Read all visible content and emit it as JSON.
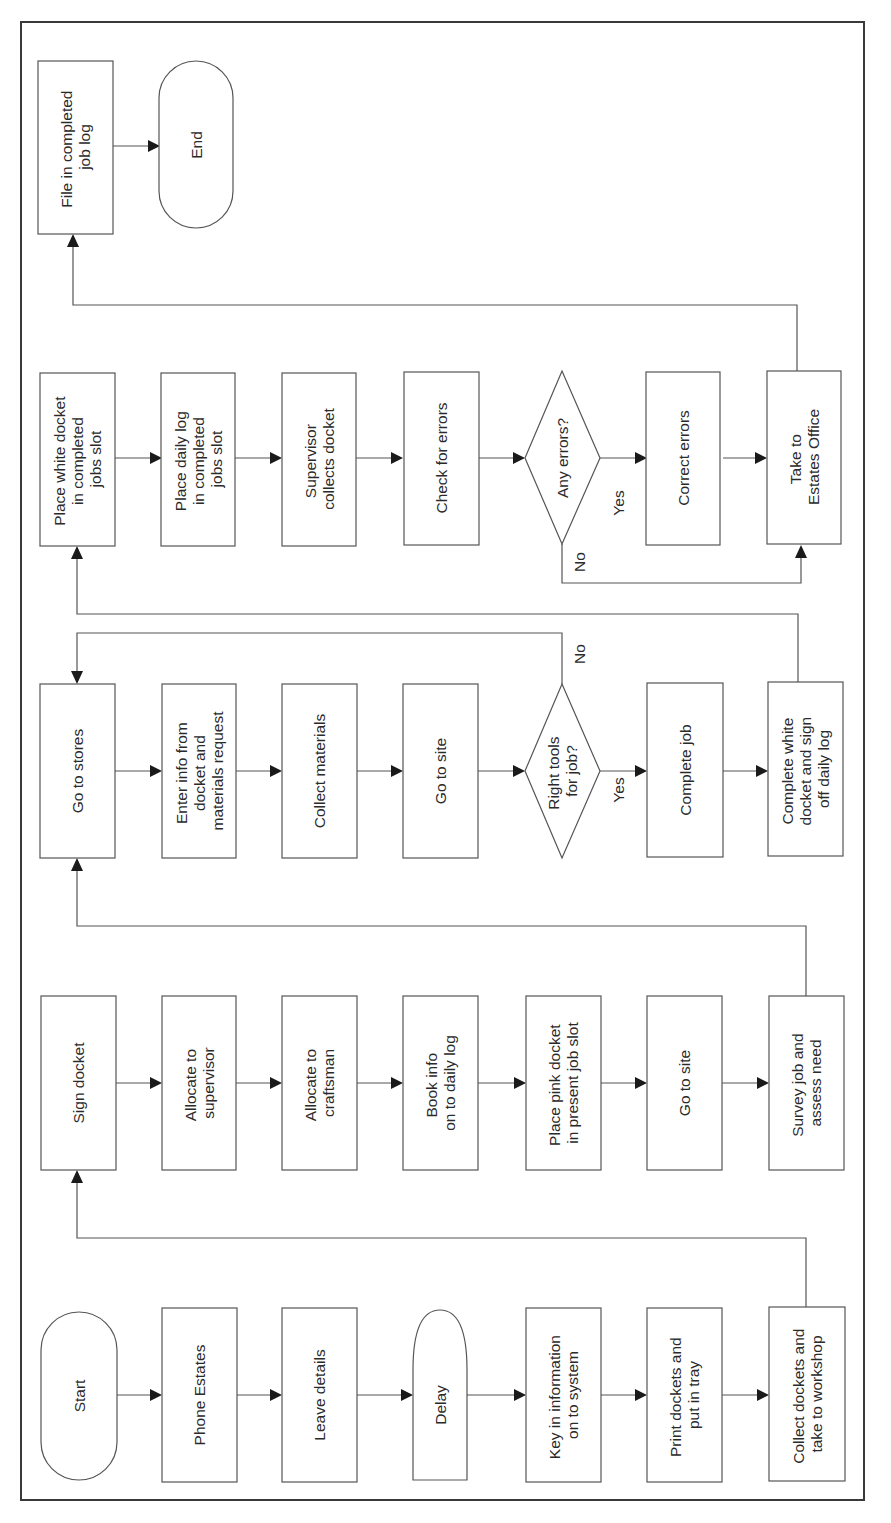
{
  "diagram": {
    "type": "flowchart",
    "orientation": "rotated-90-ccw",
    "nodes": {
      "start": {
        "shape": "terminator",
        "lines": [
          "Start"
        ]
      },
      "phone_estates": {
        "shape": "process",
        "lines": [
          "Phone Estates"
        ]
      },
      "leave_details": {
        "shape": "process",
        "lines": [
          "Leave details"
        ]
      },
      "delay": {
        "shape": "delay",
        "lines": [
          "Delay"
        ]
      },
      "key_in_info": {
        "shape": "process",
        "lines": [
          "Key in information",
          "on to system"
        ]
      },
      "print_dockets": {
        "shape": "process",
        "lines": [
          "Print dockets and",
          "put in tray"
        ]
      },
      "collect_dockets": {
        "shape": "process",
        "lines": [
          "Collect dockets and",
          "take to workshop"
        ]
      },
      "sign_docket": {
        "shape": "process",
        "lines": [
          "Sign docket"
        ]
      },
      "allocate_supervisor": {
        "shape": "process",
        "lines": [
          "Allocate to",
          "supervisor"
        ]
      },
      "allocate_craftsman": {
        "shape": "process",
        "lines": [
          "Allocate to",
          "craftsman"
        ]
      },
      "book_info": {
        "shape": "process",
        "lines": [
          "Book info",
          "on to daily log"
        ]
      },
      "place_pink_docket": {
        "shape": "process",
        "lines": [
          "Place pink docket",
          "in present job slot"
        ]
      },
      "go_to_site_1": {
        "shape": "process",
        "lines": [
          "Go to site"
        ]
      },
      "survey_job": {
        "shape": "process",
        "lines": [
          "Survey job and",
          "assess need"
        ]
      },
      "go_to_stores": {
        "shape": "process",
        "lines": [
          "Go to stores"
        ]
      },
      "enter_info": {
        "shape": "process",
        "lines": [
          "Enter info from",
          "docket and",
          "materials request"
        ]
      },
      "collect_materials": {
        "shape": "process",
        "lines": [
          "Collect materials"
        ]
      },
      "go_to_site_2": {
        "shape": "process",
        "lines": [
          "Go to site"
        ]
      },
      "right_tools": {
        "shape": "decision",
        "lines": [
          "Right tools",
          "for job?"
        ]
      },
      "complete_job": {
        "shape": "process",
        "lines": [
          "Complete job"
        ]
      },
      "complete_white_docket": {
        "shape": "process",
        "lines": [
          "Complete white",
          "docket and sign",
          "off daily log"
        ]
      },
      "place_white_docket": {
        "shape": "process",
        "lines": [
          "Place white docket",
          "in completed",
          "jobs slot"
        ]
      },
      "place_daily_log": {
        "shape": "process",
        "lines": [
          "Place daily log",
          "in completed",
          "jobs slot"
        ]
      },
      "supervisor_collects": {
        "shape": "process",
        "lines": [
          "Supervisor",
          "collects docket"
        ]
      },
      "check_errors": {
        "shape": "process",
        "lines": [
          "Check for errors"
        ]
      },
      "any_errors": {
        "shape": "decision",
        "lines": [
          "Any errors?"
        ]
      },
      "correct_errors": {
        "shape": "process",
        "lines": [
          "Correct errors"
        ]
      },
      "take_to_estates": {
        "shape": "process",
        "lines": [
          "Take to",
          "Estates Office"
        ]
      },
      "file_completed": {
        "shape": "process",
        "lines": [
          "File in completed",
          "job log"
        ]
      },
      "end": {
        "shape": "terminator",
        "lines": [
          "End"
        ]
      }
    },
    "edges": [
      {
        "from": "start",
        "to": "phone_estates"
      },
      {
        "from": "phone_estates",
        "to": "leave_details"
      },
      {
        "from": "leave_details",
        "to": "delay"
      },
      {
        "from": "delay",
        "to": "key_in_info"
      },
      {
        "from": "key_in_info",
        "to": "print_dockets"
      },
      {
        "from": "print_dockets",
        "to": "collect_dockets"
      },
      {
        "from": "collect_dockets",
        "to": "sign_docket"
      },
      {
        "from": "sign_docket",
        "to": "allocate_supervisor"
      },
      {
        "from": "allocate_supervisor",
        "to": "allocate_craftsman"
      },
      {
        "from": "allocate_craftsman",
        "to": "book_info"
      },
      {
        "from": "book_info",
        "to": "place_pink_docket"
      },
      {
        "from": "place_pink_docket",
        "to": "go_to_site_1"
      },
      {
        "from": "go_to_site_1",
        "to": "survey_job"
      },
      {
        "from": "survey_job",
        "to": "go_to_stores"
      },
      {
        "from": "go_to_stores",
        "to": "enter_info"
      },
      {
        "from": "enter_info",
        "to": "collect_materials"
      },
      {
        "from": "collect_materials",
        "to": "go_to_site_2"
      },
      {
        "from": "go_to_site_2",
        "to": "right_tools"
      },
      {
        "from": "right_tools",
        "to": "complete_job",
        "label": "Yes"
      },
      {
        "from": "right_tools",
        "to": "go_to_stores",
        "label": "No"
      },
      {
        "from": "complete_job",
        "to": "complete_white_docket"
      },
      {
        "from": "complete_white_docket",
        "to": "place_white_docket"
      },
      {
        "from": "place_white_docket",
        "to": "place_daily_log"
      },
      {
        "from": "place_daily_log",
        "to": "supervisor_collects"
      },
      {
        "from": "supervisor_collects",
        "to": "check_errors"
      },
      {
        "from": "check_errors",
        "to": "any_errors"
      },
      {
        "from": "any_errors",
        "to": "correct_errors",
        "label": "Yes"
      },
      {
        "from": "any_errors",
        "to": "take_to_estates",
        "label": "No"
      },
      {
        "from": "correct_errors",
        "to": "take_to_estates"
      },
      {
        "from": "take_to_estates",
        "to": "file_completed"
      },
      {
        "from": "file_completed",
        "to": "end"
      }
    ],
    "branch_labels": {
      "right_tools_yes": "Yes",
      "right_tools_no": "No",
      "any_errors_yes": "Yes",
      "any_errors_no": "No"
    }
  }
}
